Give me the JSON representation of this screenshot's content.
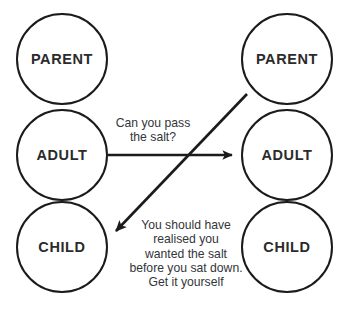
{
  "diagram": {
    "type": "transactional-analysis-crossed-transaction",
    "background_color": "#ffffff",
    "stroke_color": "#1b1b1b",
    "text_color": "#2b2b2b",
    "left_person": {
      "states": [
        {
          "id": "left-parent",
          "label": "PARENT",
          "cx": 62,
          "cy": 59,
          "r": 46
        },
        {
          "id": "left-adult",
          "label": "ADULT",
          "cx": 62,
          "cy": 155,
          "r": 46
        },
        {
          "id": "left-child",
          "label": "CHILD",
          "cx": 62,
          "cy": 247,
          "r": 46
        }
      ]
    },
    "right_person": {
      "states": [
        {
          "id": "right-parent",
          "label": "PARENT",
          "cx": 287,
          "cy": 59,
          "r": 46
        },
        {
          "id": "right-adult",
          "label": "ADULT",
          "cx": 287,
          "cy": 155,
          "r": 46
        },
        {
          "id": "right-child",
          "label": "CHILD",
          "cx": 287,
          "cy": 247,
          "r": 46
        }
      ]
    },
    "transactions": [
      {
        "id": "stimulus",
        "from": "left-adult",
        "to": "right-adult",
        "direction": "left-to-right",
        "message": "Can you pass\nthe salt?"
      },
      {
        "id": "response",
        "from": "right-parent",
        "to": "left-child",
        "direction": "diagonal-down-left",
        "message": "You should have\nrealised you\nwanted the salt\nbefore you sat down.\nGet it yourself"
      }
    ]
  }
}
